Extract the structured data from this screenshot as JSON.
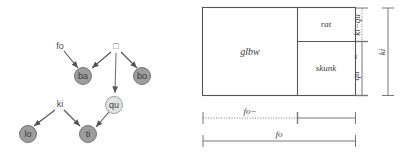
{
  "figure": {
    "left_panel": {
      "name": "directed-graph",
      "nodes": [
        {
          "id": "fo",
          "label": "fo",
          "shape": "plain",
          "x": 60,
          "y": 46
        },
        {
          "id": "tofu",
          "label": "□",
          "shape": "plain",
          "x": 116,
          "y": 46
        },
        {
          "id": "ba",
          "label": "ba",
          "shape": "circle",
          "fill": "#9d9d9d",
          "x": 83,
          "y": 76
        },
        {
          "id": "bo",
          "label": "bo",
          "shape": "circle",
          "fill": "#9d9d9d",
          "x": 142,
          "y": 76
        },
        {
          "id": "qu",
          "label": "qu",
          "shape": "circle",
          "fill": "#e2e2e2",
          "x": 114,
          "y": 105
        },
        {
          "id": "ki",
          "label": "ki",
          "shape": "plain",
          "x": 60,
          "y": 104
        },
        {
          "id": "lo",
          "label": "lo",
          "shape": "circle",
          "fill": "#9d9d9d",
          "x": 28,
          "y": 134
        },
        {
          "id": "ti",
          "label": "ti",
          "shape": "circle",
          "fill": "#9d9d9d",
          "x": 88,
          "y": 134
        }
      ],
      "edges": [
        {
          "from": "fo",
          "to": "ba"
        },
        {
          "from": "tofu",
          "to": "ba"
        },
        {
          "from": "tofu",
          "to": "bo"
        },
        {
          "from": "tofu",
          "to": "qu"
        },
        {
          "from": "ki",
          "to": "lo"
        },
        {
          "from": "ki",
          "to": "ti"
        },
        {
          "from": "qu",
          "to": "ti"
        }
      ]
    },
    "right_panel": {
      "name": "block-diagram",
      "blocks": [
        {
          "id": "glbw",
          "label": "glbw"
        },
        {
          "id": "rat",
          "label": "rat"
        },
        {
          "id": "skunk",
          "label": "skunk"
        }
      ],
      "vertical_measures": [
        {
          "id": "ki-minus-qu",
          "label": "ki−qu",
          "style": "dotted"
        },
        {
          "id": "qu",
          "label": "qu",
          "prefix": "=",
          "style": "solid"
        },
        {
          "id": "ki",
          "label": "ki",
          "style": "solid"
        }
      ],
      "horizontal_measures": [
        {
          "id": "fo-minus",
          "label": "fo−",
          "style": "dotted"
        },
        {
          "id": "fo",
          "label": "fo",
          "style": "solid"
        }
      ]
    }
  },
  "colors": {
    "node_dark": "#9d9d9d",
    "node_light": "#e2e2e2",
    "node_stroke": "#6b6b6b",
    "edge": "#555555",
    "box_stroke": "#555555",
    "measure": "#777777",
    "text": "#3c3c3c"
  }
}
